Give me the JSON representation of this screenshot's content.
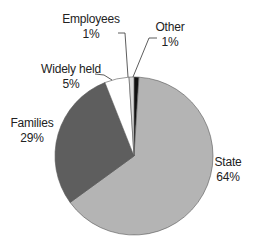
{
  "chart_data": {
    "type": "pie",
    "title": "",
    "categories": [
      "Other",
      "State",
      "Families",
      "Widely held",
      "Employees"
    ],
    "values": [
      1,
      64,
      29,
      5,
      1
    ],
    "value_labels": [
      "1%",
      "64%",
      "29%",
      "5%",
      "1%"
    ],
    "colors": [
      "#111111",
      "#b4b4b4",
      "#5e5e5e",
      "#ffffff",
      "#dcdcdc"
    ],
    "start_angle_deg": 0,
    "direction": "clockwise",
    "legend": "none (direct labels with leader lines)"
  },
  "labels": {
    "employees": {
      "name": "Employees",
      "pct": "1%"
    },
    "other": {
      "name": "Other",
      "pct": "1%"
    },
    "widely_held": {
      "name": "Widely held",
      "pct": "5%"
    },
    "families": {
      "name": "Families",
      "pct": "29%"
    },
    "state": {
      "name": "State",
      "pct": "64%"
    }
  }
}
